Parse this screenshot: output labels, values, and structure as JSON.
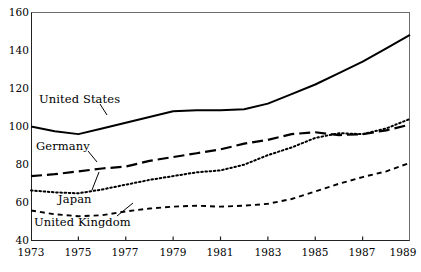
{
  "chart_data": {
    "type": "line",
    "title": "",
    "subtitle": "",
    "xlabel": "",
    "ylabel": "",
    "xlim": [
      1973,
      1989
    ],
    "ylim": [
      40,
      160
    ],
    "yticks": [
      40,
      60,
      80,
      100,
      120,
      140,
      160
    ],
    "xticks": [
      1973,
      1975,
      1977,
      1979,
      1981,
      1983,
      1985,
      1987,
      1989
    ],
    "x": [
      1973,
      1974,
      1975,
      1976,
      1977,
      1978,
      1979,
      1980,
      1981,
      1982,
      1983,
      1984,
      1985,
      1986,
      1987,
      1988,
      1989
    ],
    "grid": false,
    "legend_position": "inline-labels",
    "series": [
      {
        "name": "United States",
        "style": "solid",
        "color": "#000000",
        "values": [
          100,
          97.5,
          96,
          99,
          102,
          105,
          108,
          108.5,
          108.5,
          109,
          112,
          117,
          122,
          128,
          134,
          141,
          148
        ]
      },
      {
        "name": "Germany",
        "style": "long-dash",
        "color": "#000000",
        "values": [
          74,
          75,
          76.5,
          78,
          79,
          82,
          84,
          86,
          88,
          91,
          93,
          96,
          97,
          95.5,
          96,
          98,
          101
        ]
      },
      {
        "name": "Japan",
        "style": "dotted",
        "color": "#000000",
        "values": [
          66.5,
          65.5,
          65,
          67,
          69.5,
          72,
          74,
          76,
          77,
          80,
          85,
          89,
          94,
          96.5,
          96,
          99,
          104
        ]
      },
      {
        "name": "United Kingdom",
        "style": "short-dash",
        "color": "#000000",
        "values": [
          56,
          54,
          53,
          53.5,
          55.5,
          57,
          58,
          58.5,
          58,
          58.5,
          59.5,
          62,
          66,
          70,
          73.5,
          76.5,
          81
        ]
      }
    ],
    "axis_tick_labels_y": [
      "160",
      "140",
      "120",
      "100",
      "80",
      "60",
      "40"
    ],
    "axis_tick_labels_x": [
      "1973",
      "1975",
      "1977",
      "1979",
      "1981",
      "1983",
      "1985",
      "1987",
      "1989"
    ]
  },
  "labels": {
    "united_states": "United States",
    "germany": "Germany",
    "japan": "Japan",
    "united_kingdom": "United Kingdom"
  }
}
